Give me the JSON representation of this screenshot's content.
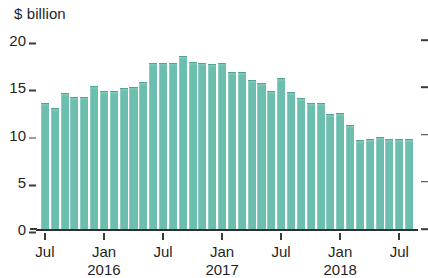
{
  "chart_data": {
    "type": "bar",
    "title": "",
    "subtitle": "",
    "xlabel": "",
    "ylabel": "$ billion",
    "ylim": [
      0,
      20
    ],
    "grid": false,
    "legend": null,
    "bar_color": "#6cbeae",
    "bar_edge_color": "#4fa695",
    "y_ticks": [
      {
        "value": 20,
        "label": "20"
      },
      {
        "value": 15,
        "label": "15"
      },
      {
        "value": 10,
        "label": "10"
      },
      {
        "value": 5,
        "label": "5"
      },
      {
        "value": 0,
        "label": "0"
      }
    ],
    "x_tick_labels": [
      {
        "index": 0,
        "label": "Jul",
        "year": ""
      },
      {
        "index": 6,
        "label": "Jan",
        "year": "2016"
      },
      {
        "index": 12,
        "label": "Jul",
        "year": ""
      },
      {
        "index": 18,
        "label": "Jan",
        "year": "2017"
      },
      {
        "index": 24,
        "label": "Jul",
        "year": ""
      },
      {
        "index": 30,
        "label": "Jan",
        "year": "2018"
      },
      {
        "index": 36,
        "label": "Jul",
        "year": ""
      }
    ],
    "categories": [
      "Jul 2015",
      "Aug 2015",
      "Sep 2015",
      "Oct 2015",
      "Nov 2015",
      "Dec 2015",
      "Jan 2016",
      "Feb 2016",
      "Mar 2016",
      "Apr 2016",
      "May 2016",
      "Jun 2016",
      "Jul 2016",
      "Aug 2016",
      "Sep 2016",
      "Oct 2016",
      "Nov 2016",
      "Dec 2016",
      "Jan 2017",
      "Feb 2017",
      "Mar 2017",
      "Apr 2017",
      "May 2017",
      "Jun 2017",
      "Jul 2017",
      "Aug 2017",
      "Sep 2017",
      "Oct 2017",
      "Nov 2017",
      "Dec 2017",
      "Jan 2018",
      "Feb 2018",
      "Mar 2018",
      "Apr 2018",
      "May 2018",
      "Jun 2018",
      "Jul 2018",
      "Aug 2018"
    ],
    "values": [
      13.3,
      12.8,
      14.4,
      14.0,
      14.0,
      15.1,
      14.6,
      14.6,
      14.9,
      15.0,
      15.6,
      17.6,
      17.6,
      17.6,
      18.3,
      17.7,
      17.6,
      17.5,
      17.6,
      16.6,
      16.6,
      15.8,
      15.4,
      14.6,
      16.0,
      14.5,
      13.9,
      13.3,
      13.3,
      12.2,
      12.3,
      11.0,
      9.4,
      9.5,
      9.7,
      9.5,
      9.5,
      9.5
    ]
  }
}
